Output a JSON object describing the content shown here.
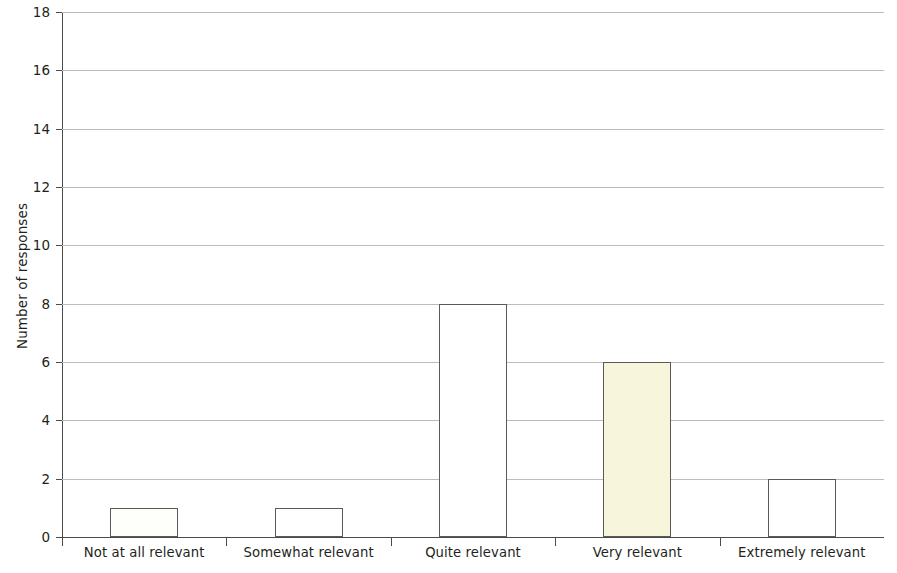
{
  "chart_data": {
    "type": "bar",
    "title": "",
    "xlabel": "",
    "ylabel": "Number of responses",
    "categories": [
      "Not at all relevant",
      "Somewhat relevant",
      "Quite relevant",
      "Very relevant",
      "Extremely relevant"
    ],
    "values": [
      1,
      1,
      8,
      6,
      2
    ],
    "ylim": [
      0,
      18
    ],
    "ytick_labels": [
      "0",
      "2",
      "4",
      "6",
      "8",
      "10",
      "12",
      "14",
      "16",
      "18"
    ],
    "ytick_values": [
      0,
      2,
      4,
      6,
      8,
      10,
      12,
      14,
      16,
      18
    ],
    "grid": "horizontal",
    "legend": "none",
    "bar_colors": [
      "#fefefa",
      "#ffffff",
      "#ffffff",
      "#f7f5dc",
      "#ffffff"
    ],
    "bar_border_color": "#5b5b55",
    "gridline_color": "#bcbcbc",
    "axis_color": "#4b4b4b",
    "text_color": "#231f20",
    "background": "#ffffff"
  }
}
